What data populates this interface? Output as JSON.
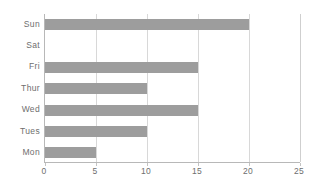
{
  "chart_data": {
    "type": "bar",
    "orientation": "horizontal",
    "title": "",
    "subtitle": "",
    "xlabel": "",
    "ylabel": "",
    "categories": [
      "Mon",
      "Tues",
      "Wed",
      "Thur",
      "Fri",
      "Sat",
      "Sun"
    ],
    "values": [
      5,
      10,
      15,
      10,
      15,
      0,
      20
    ],
    "category_order_top_to_bottom": [
      "Sun",
      "Sat",
      "Fri",
      "Thur",
      "Wed",
      "Tues",
      "Mon"
    ],
    "values_top_to_bottom": [
      20,
      0,
      15,
      10,
      15,
      10,
      5
    ],
    "xlim": [
      0,
      25
    ],
    "xticks": [
      "0",
      "5",
      "10",
      "15",
      "20",
      "25"
    ],
    "xtick_values": [
      0,
      5,
      10,
      15,
      20,
      25
    ],
    "grid": "vertical",
    "legend": "none",
    "bar_color": "#9d9d9d",
    "gridline_color": "#d8d8d8",
    "axis_color": "#b8b8b8",
    "text_color": "#6e6e6e",
    "background_color": "#ffffff"
  },
  "axis": {
    "category_labels": [
      "Sun",
      "Sat",
      "Fri",
      "Thur",
      "Wed",
      "Tues",
      "Mon"
    ],
    "value_labels": [
      "0",
      "5",
      "10",
      "15",
      "20",
      "25"
    ]
  }
}
